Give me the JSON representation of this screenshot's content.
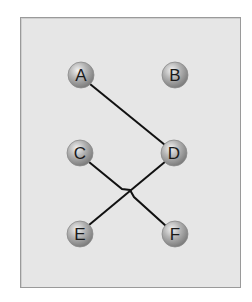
{
  "diagram": {
    "nodes": [
      {
        "id": "A",
        "label": "A",
        "x": 81,
        "y": 75
      },
      {
        "id": "B",
        "label": "B",
        "x": 175,
        "y": 75
      },
      {
        "id": "C",
        "label": "C",
        "x": 80,
        "y": 153
      },
      {
        "id": "D",
        "label": "D",
        "x": 174,
        "y": 153
      },
      {
        "id": "E",
        "label": "E",
        "x": 80,
        "y": 234
      },
      {
        "id": "F",
        "label": "F",
        "x": 175,
        "y": 234
      }
    ],
    "edges": [
      {
        "from": "A",
        "to": "D"
      },
      {
        "from": "C",
        "to": "F"
      },
      {
        "from": "D",
        "to": "E"
      }
    ],
    "colors": {
      "background": "#e6e6e6",
      "node_fill": "#9e9e9e",
      "edge": "#111111"
    }
  }
}
